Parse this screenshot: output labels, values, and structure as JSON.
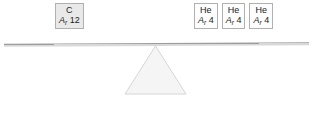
{
  "diagram": {
    "type": "balance-scale",
    "state": "balanced",
    "beam_tilt_deg": -0.28,
    "colors": {
      "block_border": "#b0b0b0",
      "block_fill_highlight": "#e9e9e9",
      "block_fill_plain": "#fdfdfd",
      "beam": "#9d9d9d",
      "pan_border": "#b9b9b9",
      "fulcrum_fill": "#f4f4f4",
      "fulcrum_stroke": "#d5d5d5",
      "text": "#1c1c1c"
    },
    "left_pan": {
      "name": "left-pan",
      "total_mass": 12,
      "blocks": [
        {
          "symbol": "C",
          "mass_label": "A",
          "mass_subscript": "r",
          "mass_value": "12",
          "style": "filled"
        }
      ]
    },
    "right_pan": {
      "name": "right-pan",
      "total_mass": 12,
      "blocks": [
        {
          "symbol": "He",
          "mass_label": "A",
          "mass_subscript": "r",
          "mass_value": "4",
          "style": "plain"
        },
        {
          "symbol": "He",
          "mass_label": "A",
          "mass_subscript": "r",
          "mass_value": "4",
          "style": "plain"
        },
        {
          "symbol": "He",
          "mass_label": "A",
          "mass_subscript": "r",
          "mass_value": "4",
          "style": "plain"
        }
      ]
    },
    "fulcrum": {
      "name": "fulcrum-triangle",
      "shape": "triangle"
    }
  }
}
